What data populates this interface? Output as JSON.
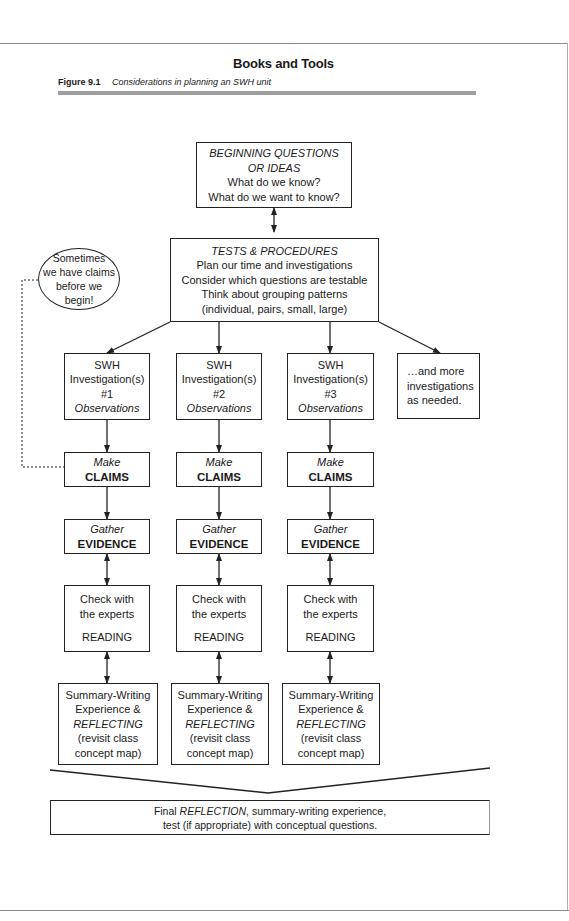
{
  "page": {
    "running_head": "Books and Tools",
    "figure_number": "Figure 9.1",
    "figure_title": "Considerations in planning an SWH unit"
  },
  "diagram": {
    "beginning": {
      "title_line1": "BEGINNING QUESTIONS",
      "title_line2": "OR IDEAS",
      "line3": "What do we know?",
      "line4": "What do we want to know?"
    },
    "tests": {
      "title": "TESTS & PROCEDURES",
      "line2": "Plan our time and investigations",
      "line3": "Consider which questions are testable",
      "line4": "Think about grouping patterns",
      "line5": "(individual, pairs, small, large)"
    },
    "note_bubble": {
      "line1": "Sometimes",
      "line2": "we have claims",
      "line3": "before we",
      "line4": "begin!"
    },
    "columns": [
      {
        "investigation": {
          "line1": "SWH",
          "line2": "Investigation(s)",
          "line3": "#1",
          "line4": "Observations"
        },
        "claims": {
          "verb": "Make",
          "noun": "CLAIMS"
        },
        "evidence": {
          "verb": "Gather",
          "noun": "EVIDENCE"
        },
        "experts": {
          "line1": "Check with",
          "line2": "the experts",
          "line3": "READING"
        },
        "summary": {
          "line1": "Summary-Writing",
          "line2": "Experience &",
          "line3": "REFLECTING",
          "line4": "(revisit class",
          "line5": "concept map)"
        }
      },
      {
        "investigation": {
          "line1": "SWH",
          "line2": "Investigation(s)",
          "line3": "#2",
          "line4": "Observations"
        },
        "claims": {
          "verb": "Make",
          "noun": "CLAIMS"
        },
        "evidence": {
          "verb": "Gather",
          "noun": "EVIDENCE"
        },
        "experts": {
          "line1": "Check with",
          "line2": "the experts",
          "line3": "READING"
        },
        "summary": {
          "line1": "Summary-Writing",
          "line2": "Experience &",
          "line3": "REFLECTING",
          "line4": "(revisit class",
          "line5": "concept map)"
        }
      },
      {
        "investigation": {
          "line1": "SWH",
          "line2": "Investigation(s)",
          "line3": "#3",
          "line4": "Observations"
        },
        "claims": {
          "verb": "Make",
          "noun": "CLAIMS"
        },
        "evidence": {
          "verb": "Gather",
          "noun": "EVIDENCE"
        },
        "experts": {
          "line1": "Check with",
          "line2": "the experts",
          "line3": "READING"
        },
        "summary": {
          "line1": "Summary-Writing",
          "line2": "Experience &",
          "line3": "REFLECTING",
          "line4": "(revisit class",
          "line5": "concept map)"
        }
      }
    ],
    "more": {
      "line1": "…and more",
      "line2": "investigations",
      "line3": "as needed."
    },
    "final": {
      "prefix": "Final ",
      "emph": "REFLECTION",
      "suffix": ", summary-writing experience,",
      "line2": "test (if appropriate) with conceptual questions."
    }
  }
}
